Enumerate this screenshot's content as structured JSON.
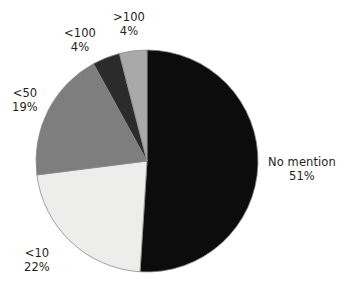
{
  "chart_data": {
    "type": "pie",
    "title": "",
    "subtitle": "",
    "xlabel": "",
    "ylabel": "",
    "legend_position": "none",
    "grid": false,
    "labels_outside": true,
    "categories": [
      "No mention",
      "<10",
      "<50",
      "<100",
      ">100"
    ],
    "values": [
      51,
      22,
      19,
      4,
      4
    ],
    "value_unit": "%",
    "slices": [
      {
        "label": "No mention",
        "value": 51,
        "value_text": "51%",
        "color": "#0d0c0c",
        "start_angle_deg": 0,
        "end_angle_deg": 183.6
      },
      {
        "label": "<10",
        "value": 22,
        "value_text": "22%",
        "color": "#ededeb",
        "start_angle_deg": 183.6,
        "end_angle_deg": 262.8
      },
      {
        "label": "<50",
        "value": 19,
        "value_text": "19%",
        "color": "#7e7e7e",
        "start_angle_deg": 262.8,
        "end_angle_deg": 331.2
      },
      {
        "label": "<100",
        "value": 4,
        "value_text": "4%",
        "color": "#2b2b2b",
        "start_angle_deg": 331.2,
        "end_angle_deg": 345.6
      },
      {
        "label": ">100",
        "value": 4,
        "value_text": "4%",
        "color": "#a9a9a9",
        "start_angle_deg": 345.6,
        "end_angle_deg": 360
      }
    ],
    "geometry": {
      "center_x": 147,
      "center_y": 161,
      "radius": 111,
      "start_at_12_oclock": true,
      "direction": "clockwise"
    },
    "stroke_color": "#8a8a8a",
    "background": "#ffffff"
  }
}
